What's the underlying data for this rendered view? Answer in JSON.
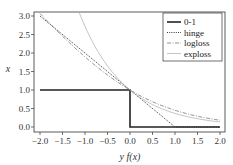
{
  "chart_data": {
    "type": "line",
    "title": "",
    "xlabel": "y f(x)",
    "ylabel": "x",
    "xlim": [
      -2.0,
      2.0
    ],
    "ylim": [
      0.0,
      3.0
    ],
    "xticks": [
      "-2.0",
      "-1.5",
      "-1.0",
      "-0.5",
      "0.0",
      "0.5",
      "1.0",
      "1.5",
      "2.0"
    ],
    "yticks": [
      "0.0",
      "0.5",
      "1.0",
      "1.5",
      "2.0",
      "2.5",
      "3.0"
    ],
    "grid": false,
    "legend_position": "upper right",
    "series": [
      {
        "name": "0-1",
        "style": "solid-thick",
        "color": "#222222",
        "x": [
          -2.0,
          0.0,
          0.0,
          2.0
        ],
        "y": [
          1.0,
          1.0,
          0.0,
          0.0
        ]
      },
      {
        "name": "hinge",
        "style": "dotted",
        "color": "#222222",
        "x": [
          -2.0,
          1.0,
          2.0
        ],
        "y": [
          3.0,
          0.0,
          0.0
        ]
      },
      {
        "name": "logloss",
        "style": "dashdot",
        "color": "#777777",
        "x": [
          -2.0,
          -1.5,
          -1.0,
          -0.5,
          0.0,
          0.5,
          1.0,
          1.5,
          2.0
        ],
        "y": [
          3.05,
          2.46,
          1.89,
          1.4,
          1.0,
          0.68,
          0.45,
          0.29,
          0.18
        ]
      },
      {
        "name": "exploss",
        "style": "solid-thin",
        "color": "#aaaaaa",
        "x": [
          -1.1,
          -1.0,
          -0.5,
          0.0,
          0.5,
          1.0,
          1.5,
          2.0
        ],
        "y": [
          3.0,
          2.72,
          1.65,
          1.0,
          0.61,
          0.37,
          0.22,
          0.14
        ]
      }
    ]
  },
  "legend": {
    "items": [
      {
        "label": "0-1"
      },
      {
        "label": "hinge"
      },
      {
        "label": "logloss"
      },
      {
        "label": "exploss"
      }
    ]
  },
  "axes": {
    "xlabel": "y f(x)",
    "ylabel": "x"
  }
}
